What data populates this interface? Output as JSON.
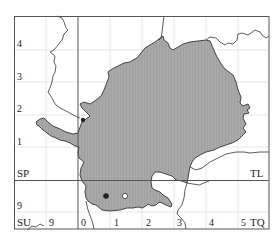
{
  "map": {
    "type": "distribution map",
    "grid_squares": {
      "top_left": "SP",
      "top_right": "TL",
      "bottom_left": "SU",
      "bottom_right": "TQ"
    },
    "y_axis_labels_left": [
      "4",
      "3",
      "2",
      "1",
      "9"
    ],
    "x_axis_labels_bottom_left": [
      "9"
    ],
    "x_axis_labels_bottom_right": [
      "0",
      "1",
      "2",
      "3",
      "4",
      "5"
    ],
    "colors": {
      "region_fill": "#a8a8a8",
      "region_stroke": "#333333",
      "frame": "#555555",
      "grid": "#d8d8d8",
      "boundary_lines": "#333333",
      "dot_filled": "#222222"
    },
    "markers": [
      {
        "kind": "filled-dot",
        "label": "record"
      },
      {
        "kind": "open-circle",
        "label": "record"
      }
    ]
  }
}
